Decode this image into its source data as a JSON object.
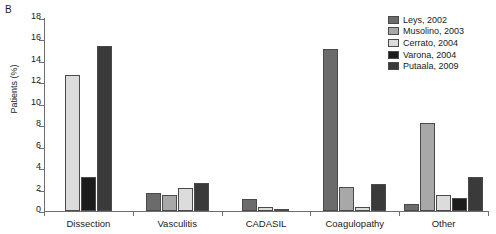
{
  "panel_label": "B",
  "legend": {
    "position": "top-right",
    "entries": [
      {
        "label": "Leys, 2002",
        "color": "#6b6b6b"
      },
      {
        "label": "Musolino, 2003",
        "color": "#a8a8a8"
      },
      {
        "label": "Cerrato, 2004",
        "color": "#dcdcdc"
      },
      {
        "label": "Varona, 2004",
        "color": "#1c1c1c"
      },
      {
        "label": "Putaala, 2009",
        "color": "#3a3a3a"
      }
    ]
  },
  "chart_data": {
    "type": "bar",
    "title": "",
    "xlabel": "",
    "ylabel": "Patients (%)",
    "ylim": [
      0,
      18
    ],
    "yticks": [
      0,
      2,
      4,
      6,
      8,
      10,
      12,
      14,
      16,
      18
    ],
    "grid": false,
    "categories": [
      "Dissection",
      "Vasculitis",
      "CADASIL",
      "Coagulopathy",
      "Other"
    ],
    "series": [
      {
        "name": "Leys, 2002",
        "color": "#6b6b6b",
        "values": [
          null,
          1.7,
          1.1,
          15.1,
          0.7
        ]
      },
      {
        "name": "Musolino, 2003",
        "color": "#a8a8a8",
        "values": [
          null,
          1.5,
          null,
          2.2,
          8.2
        ]
      },
      {
        "name": "Cerrato, 2004",
        "color": "#dcdcdc",
        "values": [
          12.7,
          2.1,
          0.4,
          0.4,
          1.5
        ]
      },
      {
        "name": "Varona, 2004",
        "color": "#1c1c1c",
        "values": [
          3.2,
          null,
          null,
          null,
          1.2
        ]
      },
      {
        "name": "Putaala, 2009",
        "color": "#3a3a3a",
        "values": [
          15.4,
          2.6,
          0.15,
          2.5,
          3.2
        ]
      }
    ]
  }
}
